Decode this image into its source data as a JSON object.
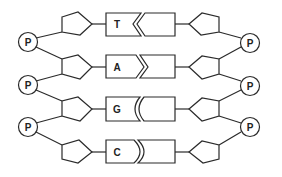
{
  "diagram": {
    "colors": {
      "stroke": "#2a2a2a",
      "background": "#ffffff"
    },
    "phosphate_label": "P",
    "left_phosphates": [
      "P",
      "P",
      "P"
    ],
    "right_phosphates": [
      "P",
      "P",
      "P"
    ],
    "base_pairs": [
      {
        "left_base": "T",
        "right_base": "",
        "connector": "chevron-notch-left",
        "pair": "T-A"
      },
      {
        "left_base": "A",
        "right_base": "",
        "connector": "chevron-point-right",
        "pair": "A-T"
      },
      {
        "left_base": "G",
        "right_base": "",
        "connector": "double-curve-concave",
        "pair": "G-C"
      },
      {
        "left_base": "C",
        "right_base": "",
        "connector": "double-curve-convex",
        "pair": "C-G"
      }
    ],
    "components": {
      "phosphate": "circle",
      "sugar": "pentagon",
      "base": "rectangle"
    }
  }
}
